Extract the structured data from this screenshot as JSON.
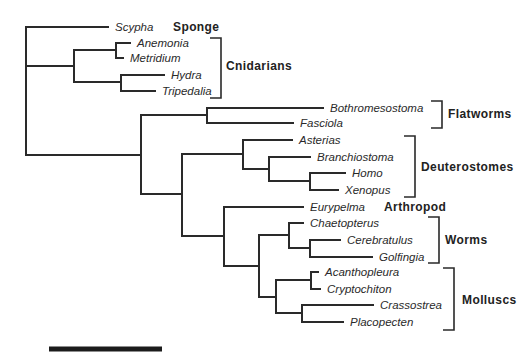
{
  "diagram": {
    "type": "phylogenetic-tree",
    "line_color": "#2a2a2a",
    "background": "#ffffff",
    "taxa": [
      {
        "name": "Scypha",
        "y": 27,
        "x_end": 108
      },
      {
        "name": "Anemonia",
        "y": 43,
        "x_end": 130
      },
      {
        "name": "Metridium",
        "y": 58,
        "x_end": 123
      },
      {
        "name": "Hydra",
        "y": 75,
        "x_end": 164
      },
      {
        "name": "Tripedalia",
        "y": 91,
        "x_end": 155
      },
      {
        "name": "Bothromesostoma",
        "y": 108,
        "x_end": 323
      },
      {
        "name": "Fasciola",
        "y": 123,
        "x_end": 293
      },
      {
        "name": "Asterias",
        "y": 140,
        "x_end": 292
      },
      {
        "name": "Branchiostoma",
        "y": 157,
        "x_end": 310
      },
      {
        "name": "Homo",
        "y": 173,
        "x_end": 345
      },
      {
        "name": "Xenopus",
        "y": 190,
        "x_end": 338
      },
      {
        "name": "Eurypelma",
        "y": 207,
        "x_end": 303
      },
      {
        "name": "Chaetopterus",
        "y": 223,
        "x_end": 303
      },
      {
        "name": "Cerebratulus",
        "y": 240,
        "x_end": 340
      },
      {
        "name": "Golfingia",
        "y": 257,
        "x_end": 372
      },
      {
        "name": "Acanthopleura",
        "y": 272,
        "x_end": 318
      },
      {
        "name": "Cryptochiton",
        "y": 289,
        "x_end": 320
      },
      {
        "name": "Crassostrea",
        "y": 305,
        "x_end": 373
      },
      {
        "name": "Placopecten",
        "y": 322,
        "x_end": 343
      }
    ],
    "groups": [
      {
        "label": "Sponge",
        "x": 173,
        "y": 27,
        "bracket": null
      },
      {
        "label": "Cnidarians",
        "x": 226,
        "y": 66,
        "bracket": {
          "x": 221,
          "y1": 38,
          "y2": 98,
          "tick": 11
        }
      },
      {
        "label": "Flatworms",
        "x": 448,
        "y": 114,
        "bracket": {
          "x": 442,
          "y1": 101,
          "y2": 128,
          "tick": 11
        }
      },
      {
        "label": "Deuterostomes",
        "x": 421,
        "y": 167,
        "bracket": {
          "x": 415,
          "y1": 136,
          "y2": 197,
          "tick": 11
        }
      },
      {
        "label": "Arthropod",
        "x": 384,
        "y": 207,
        "bracket": null
      },
      {
        "label": "Worms",
        "x": 445,
        "y": 240,
        "bracket": {
          "x": 439,
          "y1": 217,
          "y2": 263,
          "tick": 11
        }
      },
      {
        "label": "Molluscs",
        "x": 462,
        "y": 300,
        "bracket": {
          "x": 454,
          "y1": 268,
          "y2": 330,
          "tick": 11
        }
      }
    ],
    "scale_bar": {
      "x1": 49,
      "x2": 162,
      "y": 349,
      "thickness": 5
    }
  }
}
